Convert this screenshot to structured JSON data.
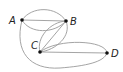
{
  "diagram": {
    "type": "multigraph",
    "vertices": [
      {
        "id": "A",
        "label": "A",
        "x": 22,
        "y": 20
      },
      {
        "id": "B",
        "label": "B",
        "x": 66,
        "y": 21
      },
      {
        "id": "C",
        "label": "C",
        "x": 40,
        "y": 52
      },
      {
        "id": "D",
        "label": "D",
        "x": 107,
        "y": 53
      }
    ],
    "edges": [
      {
        "from": "A",
        "to": "B",
        "shape": "straight"
      },
      {
        "from": "A",
        "to": "B",
        "shape": "arc-above"
      },
      {
        "from": "A",
        "to": "B",
        "shape": "arc-below"
      },
      {
        "from": "B",
        "to": "C",
        "shape": "straight"
      },
      {
        "from": "B",
        "to": "C",
        "shape": "arc-left"
      },
      {
        "from": "B",
        "to": "C",
        "shape": "arc-right"
      },
      {
        "from": "C",
        "to": "D",
        "shape": "straight"
      },
      {
        "from": "C",
        "to": "D",
        "shape": "arc-above"
      },
      {
        "from": "A",
        "to": "D",
        "shape": "arc-below"
      }
    ],
    "colors": {
      "edge": "#9a9a9a",
      "vertex": "#111111",
      "label": "#222222"
    }
  }
}
